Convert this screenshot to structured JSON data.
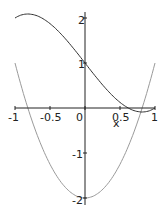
{
  "chart_data": {
    "type": "line",
    "title": "",
    "xlabel": "x",
    "ylabel": "",
    "xlim": [
      -1,
      1
    ],
    "ylim": [
      -2,
      2.1
    ],
    "grid": false,
    "legend": null,
    "x_ticks": [
      {
        "value": -1,
        "label": "-1"
      },
      {
        "value": -0.5,
        "label": "-0.5"
      },
      {
        "value": 0,
        "label": "0"
      },
      {
        "value": 0.5,
        "label": "0.5"
      },
      {
        "value": 1,
        "label": "1"
      }
    ],
    "y_ticks": [
      {
        "value": 2,
        "label": "2"
      },
      {
        "value": 1,
        "label": "1"
      },
      {
        "value": -1,
        "label": "-1"
      },
      {
        "value": -2,
        "label": "-2"
      }
    ],
    "series": [
      {
        "name": "f(x) = x^3 - 2x + 1",
        "color": "#333333",
        "x": [
          -1,
          -0.8,
          -0.6,
          -0.4,
          -0.2,
          0,
          0.2,
          0.4,
          0.6,
          0.618,
          0.8,
          0.816,
          1
        ],
        "values": [
          2.0,
          2.088,
          1.984,
          1.736,
          1.392,
          1.0,
          0.608,
          0.264,
          0.016,
          0.0,
          -0.088,
          -0.089,
          0.0
        ]
      },
      {
        "name": "f'(x) = 3x^2 - 2",
        "color": "#9a9a9a",
        "x": [
          -1,
          -0.816,
          -0.6,
          -0.4,
          -0.2,
          0,
          0.2,
          0.4,
          0.6,
          0.816,
          1
        ],
        "values": [
          1.0,
          0.0,
          -0.92,
          -1.52,
          -1.88,
          -2.0,
          -1.88,
          -1.52,
          -0.92,
          0.0,
          1.0
        ]
      }
    ]
  },
  "axes": {
    "x_label": "x",
    "x_tick_labels": [
      "-1",
      "-0.5",
      "0",
      "0.5",
      "1"
    ],
    "y_tick_labels": [
      "2",
      "1",
      "-1",
      "-2"
    ]
  }
}
